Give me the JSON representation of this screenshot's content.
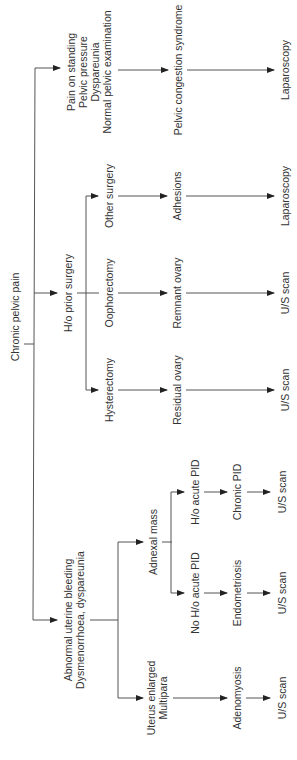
{
  "diagram": {
    "type": "flowchart",
    "orientation": "rotated-90-ccw",
    "line_color": "#333333",
    "root": {
      "label": "Chronic pelvic pain"
    },
    "branches": {
      "pelvic_congestion": {
        "criteria": [
          "Pain on standing",
          "Pelvic pressure",
          "Dyspareunia",
          "Normal pelvic examination"
        ],
        "diagnosis": "Pelvic congestion syndrome",
        "investigation": "Laparoscopy"
      },
      "prior_surgery": {
        "label": "H/o prior surgery",
        "children": [
          {
            "label": "Other surgery",
            "diagnosis": "Adhesions",
            "investigation": "Laparoscopy"
          },
          {
            "label": "Oophorectomy",
            "diagnosis": "Remnant ovary",
            "investigation": "U/S scan"
          },
          {
            "label": "Hysterectomy",
            "diagnosis": "Residual ovary",
            "investigation": "U/S scan"
          }
        ]
      },
      "abnormal_bleeding": {
        "label_lines": [
          "Abnormal uterine bleeding",
          "Dysmenorrhoea, dyspareunia"
        ],
        "adnexal": {
          "label": "Adnexal mass",
          "children": [
            {
              "label": "H/o acute PID",
              "diagnosis": "Chronic PID",
              "investigation": "U/S scan"
            },
            {
              "label": "No H/o acute PID",
              "diagnosis": "Endometriosis",
              "investigation": "U/S scan"
            }
          ]
        },
        "uterus": {
          "label_lines": [
            "Uterus enlarged",
            "Multipara"
          ],
          "diagnosis": "Adenomyosis",
          "investigation": "U/S scan"
        }
      }
    }
  }
}
